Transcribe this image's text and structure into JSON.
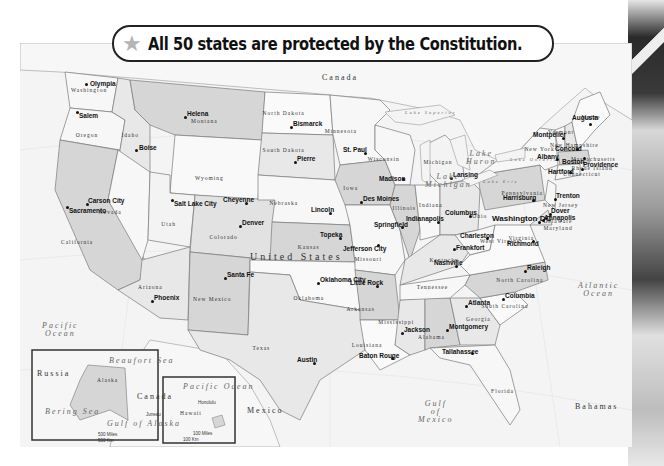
{
  "title": {
    "icon": "star-icon",
    "text": "All 50 states are protected by the Constitution."
  },
  "colors": {
    "state_light": "#f7f7f7",
    "state_mid": "#e4e4e4",
    "state_dark": "#cfcfcf",
    "ocean": "#f4f4f4",
    "border": "#7a7a7a",
    "banner_border": "#222222",
    "star": "#b5b5b5"
  },
  "map": {
    "country_label": "United States",
    "neighbors": [
      {
        "name": "Canada",
        "x": 322,
        "y": 74
      },
      {
        "name": "Mexico",
        "x": 247,
        "y": 407
      }
    ],
    "water_bodies": [
      {
        "name": "Pacific Ocean",
        "lines": [
          "Pacific",
          "Ocean"
        ],
        "x": 42,
        "y": 322
      },
      {
        "name": "Atlantic Ocean",
        "lines": [
          "Atlantic",
          "Ocean"
        ],
        "x": 578,
        "y": 282
      },
      {
        "name": "Gulf of Mexico",
        "lines": [
          "Gulf",
          "of",
          "Mexico"
        ],
        "x": 418,
        "y": 400
      },
      {
        "name": "Lake Superior",
        "lines": [
          "Lake Superior"
        ],
        "x": 405,
        "y": 111
      },
      {
        "name": "Lake Michigan",
        "lines": [
          "Lake",
          "Michigan"
        ],
        "x": 425,
        "y": 173
      },
      {
        "name": "Lake Huron",
        "lines": [
          "Lake",
          "Huron"
        ],
        "x": 466,
        "y": 150
      },
      {
        "name": "Lake Erie",
        "lines": [
          "Lake Erie"
        ],
        "x": 483,
        "y": 180
      },
      {
        "name": "Lake Ontario",
        "lines": [
          "Lake Ontario"
        ],
        "x": 510,
        "y": 158
      }
    ],
    "other_labels": [
      {
        "name": "Bahamas",
        "x": 575,
        "y": 403
      }
    ],
    "states": [
      {
        "name": "Washington",
        "x": 88,
        "y": 88
      },
      {
        "name": "Oregon",
        "x": 86,
        "y": 133
      },
      {
        "name": "Idaho",
        "x": 130,
        "y": 133
      },
      {
        "name": "Montana",
        "x": 203,
        "y": 119
      },
      {
        "name": "Wyoming",
        "x": 207,
        "y": 176
      },
      {
        "name": "North Dakota",
        "x": 283,
        "y": 111
      },
      {
        "name": "South Dakota",
        "x": 283,
        "y": 148
      },
      {
        "name": "Minnesota",
        "x": 340,
        "y": 129
      },
      {
        "name": "Wisconsin",
        "x": 383,
        "y": 157
      },
      {
        "name": "Michigan",
        "x": 437,
        "y": 160
      },
      {
        "name": "Iowa",
        "x": 350,
        "y": 186
      },
      {
        "name": "Nebraska",
        "x": 283,
        "y": 201
      },
      {
        "name": "Illinois",
        "x": 406,
        "y": 206
      },
      {
        "name": "Indiana",
        "x": 431,
        "y": 203
      },
      {
        "name": "Ohio",
        "x": 479,
        "y": 214
      },
      {
        "name": "Pennsylvania",
        "x": 522,
        "y": 191
      },
      {
        "name": "New York",
        "x": 538,
        "y": 147
      },
      {
        "name": "Vermont",
        "x": 560,
        "y": 130
      },
      {
        "name": "New Hampshire",
        "x": 572,
        "y": 143
      },
      {
        "name": "Maine",
        "x": 590,
        "y": 115
      },
      {
        "name": "Massachusetts",
        "x": 593,
        "y": 157
      },
      {
        "name": "Rhode Island",
        "x": 592,
        "y": 166
      },
      {
        "name": "Connecticut",
        "x": 582,
        "y": 172
      },
      {
        "name": "New Jersey",
        "x": 560,
        "y": 203
      },
      {
        "name": "Delaware",
        "x": 557,
        "y": 219
      },
      {
        "name": "Maryland",
        "x": 557,
        "y": 226
      },
      {
        "name": "Nevada",
        "x": 109,
        "y": 210
      },
      {
        "name": "Utah",
        "x": 168,
        "y": 222
      },
      {
        "name": "Colorado",
        "x": 223,
        "y": 235
      },
      {
        "name": "California",
        "x": 78,
        "y": 240
      },
      {
        "name": "Kansas",
        "x": 308,
        "y": 245
      },
      {
        "name": "Missouri",
        "x": 368,
        "y": 257
      },
      {
        "name": "Kentucky",
        "x": 443,
        "y": 258
      },
      {
        "name": "West Virginia",
        "x": 502,
        "y": 239
      },
      {
        "name": "Virginia",
        "x": 522,
        "y": 236
      },
      {
        "name": "Tennessee",
        "x": 432,
        "y": 285
      },
      {
        "name": "North Carolina",
        "x": 520,
        "y": 278
      },
      {
        "name": "Arizona",
        "x": 150,
        "y": 285
      },
      {
        "name": "New Mexico",
        "x": 210,
        "y": 297
      },
      {
        "name": "Oklahoma",
        "x": 307,
        "y": 296
      },
      {
        "name": "Arkansas",
        "x": 360,
        "y": 307
      },
      {
        "name": "South Carolina",
        "x": 505,
        "y": 304
      },
      {
        "name": "Mississippi",
        "x": 397,
        "y": 320
      },
      {
        "name": "Alabama",
        "x": 430,
        "y": 335
      },
      {
        "name": "Georgia",
        "x": 478,
        "y": 317
      },
      {
        "name": "Texas",
        "x": 261,
        "y": 346
      },
      {
        "name": "Louisiana",
        "x": 367,
        "y": 343
      },
      {
        "name": "Florida",
        "x": 503,
        "y": 389
      }
    ],
    "capitals": [
      {
        "name": "Olympia",
        "x": 86,
        "y": 84,
        "dx": 4,
        "dy": -3
      },
      {
        "name": "Salem",
        "x": 77,
        "y": 112,
        "dx": 2,
        "dy": 1
      },
      {
        "name": "Boise",
        "x": 136,
        "y": 150,
        "dx": 3,
        "dy": -5
      },
      {
        "name": "Helena",
        "x": 185,
        "y": 117,
        "dx": 2,
        "dy": -6
      },
      {
        "name": "Bismarck",
        "x": 291,
        "y": 127,
        "dx": 2,
        "dy": -6
      },
      {
        "name": "Pierre",
        "x": 295,
        "y": 162,
        "dx": 2,
        "dy": -6
      },
      {
        "name": "St. Paul",
        "x": 365,
        "y": 153,
        "dx": -22,
        "dy": -6
      },
      {
        "name": "Madison",
        "x": 403,
        "y": 179,
        "dx": -24,
        "dy": -3
      },
      {
        "name": "Lansing",
        "x": 451,
        "y": 178,
        "dx": 2,
        "dy": -6
      },
      {
        "name": "Augusta",
        "x": 590,
        "y": 124,
        "dx": -18,
        "dy": -9
      },
      {
        "name": "Montpelier",
        "x": 563,
        "y": 138,
        "dx": -30,
        "dy": -6
      },
      {
        "name": "Concord",
        "x": 577,
        "y": 149,
        "dx": -22,
        "dy": -3
      },
      {
        "name": "Albany",
        "x": 557,
        "y": 159,
        "dx": -20,
        "dy": -5
      },
      {
        "name": "Boston",
        "x": 584,
        "y": 158,
        "dx": -22,
        "dy": 1
      },
      {
        "name": "Providence",
        "x": 582,
        "y": 169,
        "dx": 1,
        "dy": -7
      },
      {
        "name": "Hartford",
        "x": 570,
        "y": 172,
        "dx": -22,
        "dy": -3
      },
      {
        "name": "Harrisburg",
        "x": 533,
        "y": 200,
        "dx": -30,
        "dy": -5
      },
      {
        "name": "Trenton",
        "x": 555,
        "y": 199,
        "dx": 1,
        "dy": -6
      },
      {
        "name": "Dover",
        "x": 550,
        "y": 214,
        "dx": 1,
        "dy": -6
      },
      {
        "name": "Annapolis",
        "x": 543,
        "y": 220,
        "dx": 1,
        "dy": -5
      },
      {
        "name": "Washington DC",
        "x": 539,
        "y": 222,
        "dx": -47,
        "dy": -7
      },
      {
        "name": "Carson City",
        "x": 87,
        "y": 204,
        "dx": 1,
        "dy": -6
      },
      {
        "name": "Sacramento",
        "x": 67,
        "y": 207,
        "dx": 2,
        "dy": 1
      },
      {
        "name": "Salt Lake City",
        "x": 172,
        "y": 200,
        "dx": 2,
        "dy": 1
      },
      {
        "name": "Cheyenne",
        "x": 246,
        "y": 203,
        "dx": -23,
        "dy": -6
      },
      {
        "name": "Denver",
        "x": 240,
        "y": 226,
        "dx": 2,
        "dy": -6
      },
      {
        "name": "Lincoln",
        "x": 330,
        "y": 213,
        "dx": -19,
        "dy": -6
      },
      {
        "name": "Des Moines",
        "x": 361,
        "y": 202,
        "dx": 2,
        "dy": -6
      },
      {
        "name": "Springfield",
        "x": 402,
        "y": 227,
        "dx": -28,
        "dy": -5
      },
      {
        "name": "Indianapolis",
        "x": 438,
        "y": 222,
        "dx": -32,
        "dy": -6
      },
      {
        "name": "Columbus",
        "x": 470,
        "y": 216,
        "dx": -25,
        "dy": -6
      },
      {
        "name": "Charleston",
        "x": 487,
        "y": 238,
        "dx": -27,
        "dy": -5
      },
      {
        "name": "Frankfort",
        "x": 454,
        "y": 249,
        "dx": 2,
        "dy": -4
      },
      {
        "name": "Richmond",
        "x": 533,
        "y": 241,
        "dx": -26,
        "dy": 0
      },
      {
        "name": "Topeka",
        "x": 340,
        "y": 238,
        "dx": -20,
        "dy": -6
      },
      {
        "name": "Jefferson City",
        "x": 378,
        "y": 245,
        "dx": -35,
        "dy": 1
      },
      {
        "name": "Nashville",
        "x": 456,
        "y": 266,
        "dx": -22,
        "dy": -6
      },
      {
        "name": "Raleigh",
        "x": 525,
        "y": 271,
        "dx": 2,
        "dy": -6
      },
      {
        "name": "Santa Fe",
        "x": 225,
        "y": 278,
        "dx": 2,
        "dy": -6
      },
      {
        "name": "Phoenix",
        "x": 152,
        "y": 301,
        "dx": 2,
        "dy": -6
      },
      {
        "name": "Oklahoma City",
        "x": 318,
        "y": 283,
        "dx": 2,
        "dy": -6
      },
      {
        "name": "Little Rock",
        "x": 377,
        "y": 286,
        "dx": -27,
        "dy": -6
      },
      {
        "name": "Columbia",
        "x": 503,
        "y": 299,
        "dx": 2,
        "dy": -6
      },
      {
        "name": "Atlanta",
        "x": 466,
        "y": 306,
        "dx": 2,
        "dy": -6
      },
      {
        "name": "Jackson",
        "x": 402,
        "y": 333,
        "dx": 2,
        "dy": -6
      },
      {
        "name": "Montgomery",
        "x": 447,
        "y": 330,
        "dx": 2,
        "dy": -6
      },
      {
        "name": "Austin",
        "x": 314,
        "y": 363,
        "dx": -17,
        "dy": -6
      },
      {
        "name": "Baton Rouge",
        "x": 392,
        "y": 358,
        "dx": -33,
        "dy": -5
      },
      {
        "name": "Tallahassee",
        "x": 472,
        "y": 353,
        "dx": -30,
        "dy": -4
      }
    ],
    "insets": [
      {
        "name": "Alaska",
        "labels": [
          {
            "text": "Russia",
            "x": 37,
            "y": 370,
            "cls": "country"
          },
          {
            "text": "Alaska",
            "x": 97,
            "y": 378,
            "cls": "state"
          },
          {
            "text": "Canada",
            "x": 137,
            "y": 393,
            "cls": "country"
          },
          {
            "text": "Beaufort Sea",
            "x": 109,
            "y": 357,
            "cls": "water"
          },
          {
            "text": "Bering Sea",
            "x": 45,
            "y": 408,
            "cls": "water"
          },
          {
            "text": "Gulf of Alaska",
            "x": 107,
            "y": 420,
            "cls": "water"
          },
          {
            "text": "Juneau",
            "x": 146,
            "y": 413,
            "cls": "small"
          },
          {
            "text": "500 Miles",
            "x": 98,
            "y": 433,
            "cls": "small"
          },
          {
            "text": "500 Km",
            "x": 98,
            "y": 439,
            "cls": "small"
          }
        ],
        "scale_miles": "500 Miles",
        "scale_km": "500 Km"
      },
      {
        "name": "Hawaii",
        "labels": [
          {
            "text": "Pacific Ocean",
            "x": 183,
            "y": 383,
            "cls": "water"
          },
          {
            "text": "Honolulu",
            "x": 198,
            "y": 401,
            "cls": "small"
          },
          {
            "text": "Hawaii",
            "x": 180,
            "y": 411,
            "cls": "state"
          },
          {
            "text": "100 Miles",
            "x": 193,
            "y": 432,
            "cls": "small"
          },
          {
            "text": "100 Km",
            "x": 183,
            "y": 438,
            "cls": "small"
          }
        ],
        "scale_miles": "100 Miles",
        "scale_km": "100 Km"
      }
    ]
  }
}
